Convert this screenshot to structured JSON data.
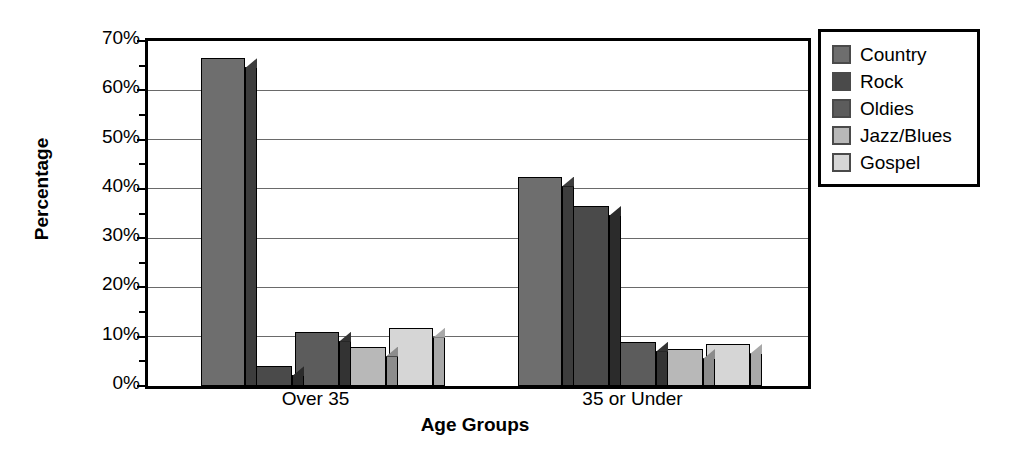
{
  "chart_data": {
    "type": "bar",
    "title": "",
    "xlabel": "Age Groups",
    "ylabel": "Percentage",
    "categories": [
      "Over 35",
      "35 or Under"
    ],
    "series": [
      {
        "name": "Country",
        "values": [
          66.5,
          42.5
        ],
        "color": "#6e6e6e",
        "side_color": "#3d3d3d"
      },
      {
        "name": "Rock",
        "values": [
          4.0,
          36.5
        ],
        "color": "#4a4a4a",
        "side_color": "#2b2b2b"
      },
      {
        "name": "Oldies",
        "values": [
          11.0,
          9.0
        ],
        "color": "#5c5c5c",
        "side_color": "#333333"
      },
      {
        "name": "Jazz/Blues",
        "values": [
          8.0,
          7.5
        ],
        "color": "#b8b8b8",
        "side_color": "#8c8c8c"
      },
      {
        "name": "Gospel",
        "values": [
          11.8,
          8.5
        ],
        "color": "#d6d6d6",
        "side_color": "#a8a8a8"
      }
    ],
    "ylim": [
      0,
      70
    ],
    "y_major_ticks": [
      0,
      10,
      20,
      30,
      40,
      50,
      60,
      70
    ],
    "y_minor_ticks": [
      5,
      15,
      25,
      35,
      45,
      55,
      65
    ],
    "y_tick_labels": [
      "0%",
      "10%",
      "20%",
      "30%",
      "40%",
      "50%",
      "60%",
      "70%"
    ],
    "grid": true,
    "legend_position": "right",
    "value_suffix": "%"
  },
  "axes": {
    "y_title": "Percentage",
    "x_title": "Age Groups"
  },
  "legend": {
    "entries": [
      {
        "label": "Country",
        "swatch": "#6e6e6e"
      },
      {
        "label": "Rock",
        "swatch": "#4a4a4a"
      },
      {
        "label": "Oldies",
        "swatch": "#5c5c5c"
      },
      {
        "label": "Jazz/Blues",
        "swatch": "#b8b8b8"
      },
      {
        "label": "Gospel",
        "swatch": "#d6d6d6"
      }
    ]
  },
  "colors": {
    "background": "#ffffff",
    "axis": "#000000",
    "gridline": "#6a6a6a",
    "text": "#000000"
  }
}
